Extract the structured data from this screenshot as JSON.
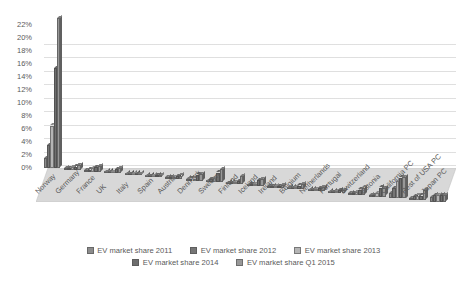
{
  "chart_data": {
    "type": "bar",
    "title": "",
    "subtitle": "",
    "xlabel": "",
    "ylabel": "",
    "ylim": [
      0,
      23
    ],
    "yticks": [
      "0%",
      "2%",
      "4%",
      "6%",
      "8%",
      "10%",
      "12%",
      "14%",
      "16%",
      "18%",
      "20%",
      "22%"
    ],
    "ytick_values": [
      0,
      2,
      4,
      6,
      8,
      10,
      12,
      14,
      16,
      18,
      20,
      22
    ],
    "grid": true,
    "legend_position": "bottom",
    "style": "3d-clustered-column",
    "categories": [
      "Norway",
      "Germany",
      "France",
      "UK",
      "Italy",
      "Spain",
      "Austria",
      "Denmark",
      "Sweden",
      "Finland",
      "Iceland",
      "Ireland",
      "Belgium",
      "Netherlands",
      "Portugal",
      "Switzerland",
      "Estonia",
      "California PC",
      "Rest of USA PC",
      "Japan PC"
    ],
    "series": [
      {
        "name": "EV market share 2011",
        "color": "#8c8c8c",
        "values": [
          1.5,
          0.2,
          0.2,
          0.1,
          0.1,
          0.1,
          0.1,
          0.1,
          0.2,
          0.1,
          0.1,
          0.1,
          0.1,
          0.1,
          0.1,
          0.1,
          0.1,
          0.8,
          0.3,
          0.8
        ]
      },
      {
        "name": "EV market share 2012",
        "color": "#767676",
        "values": [
          3.5,
          0.3,
          0.3,
          0.2,
          0.1,
          0.1,
          0.2,
          0.3,
          0.5,
          0.2,
          0.2,
          0.1,
          0.2,
          0.2,
          0.2,
          0.3,
          0.3,
          1.6,
          0.6,
          1.0
        ]
      },
      {
        "name": "EV market share 2013",
        "color": "#b5b5b5",
        "values": [
          6.5,
          0.4,
          0.5,
          0.2,
          0.1,
          0.1,
          0.3,
          0.3,
          0.7,
          0.3,
          0.3,
          0.2,
          0.3,
          0.3,
          0.3,
          0.4,
          0.6,
          2.6,
          0.7,
          1.0
        ]
      },
      {
        "name": "EV market share 2014",
        "color": "#6e6e6e",
        "values": [
          15.3,
          0.5,
          0.7,
          0.6,
          0.1,
          0.2,
          0.4,
          0.9,
          1.5,
          0.5,
          0.9,
          0.3,
          0.6,
          0.5,
          0.4,
          0.8,
          1.4,
          3.2,
          0.7,
          1.0
        ]
      },
      {
        "name": "EV market share Q1 2015",
        "color": "#989898",
        "values": [
          23.0,
          0.7,
          0.9,
          0.8,
          0.2,
          0.2,
          0.5,
          1.0,
          2.0,
          1.2,
          1.0,
          0.4,
          0.8,
          0.6,
          0.5,
          1.1,
          1.3,
          3.3,
          1.6,
          1.0
        ]
      }
    ]
  },
  "legend": {
    "items": [
      {
        "label": "EV market share 2011"
      },
      {
        "label": "EV market share 2012"
      },
      {
        "label": "EV market share 2013"
      },
      {
        "label": "EV market share 2014"
      },
      {
        "label": "EV market share Q1 2015"
      }
    ]
  },
  "colors": {
    "background": "#ffffff",
    "text": "#5a5a5a",
    "gridline": "#d9d9d9",
    "floor": "#d6d6d6"
  }
}
